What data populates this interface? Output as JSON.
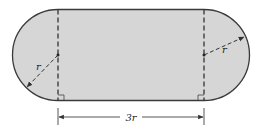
{
  "figure": {
    "labels": {
      "radius_left": "r",
      "radius_right": "r",
      "length": "3r"
    },
    "colors": {
      "fill": "#d6d6d6",
      "stroke": "#3a3a3a",
      "background": "#ffffff"
    }
  }
}
